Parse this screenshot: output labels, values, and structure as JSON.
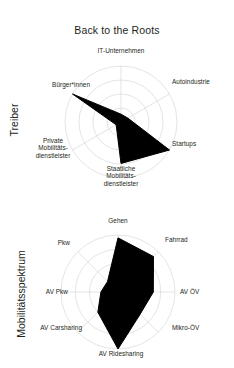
{
  "figure": {
    "title": "Back to the Roots",
    "background": "#ffffff",
    "fill_color": "#000000",
    "grid_color": "#d9d9d9",
    "text_color": "#231f20"
  },
  "panels": [
    {
      "id": "treiber",
      "axis_title": "Treiber",
      "center": {
        "x": 121,
        "y": 122
      },
      "radius": 56,
      "labels": [
        "IT-Unternehmen",
        "Autoindustrie",
        "Startups",
        "Staatliche\nMobilitäts-\ndienstleister",
        "Private\nMobilitäts-\ndienstleister",
        "Bürger*innen"
      ]
    },
    {
      "id": "mobilitaetsspektrum",
      "axis_title": "Mobilitätsspektrum",
      "center": {
        "x": 118,
        "y": 292
      },
      "radius": 57,
      "labels": [
        "Gehen",
        "Fahrrad",
        "AV ÖV",
        "Mikro-ÖV",
        "AV Ridesharing",
        "AV Carsharing",
        "AV Pkw",
        "Pkw"
      ]
    }
  ],
  "chart_data": [
    {
      "type": "radar",
      "title": "Back to the Roots",
      "group": "Treiber",
      "categories": [
        "IT-Unternehmen",
        "Autoindustrie",
        "Startups",
        "Staatliche Mobilitätsdienstleister",
        "Private Mobilitätsdienstleister",
        "Bürger*innen"
      ],
      "values": [
        0.14,
        0.14,
        1.0,
        0.74,
        0.1,
        1.0
      ],
      "rlim": [
        0,
        1
      ],
      "n_rings": 4,
      "grid": true,
      "legend": "none",
      "xlabel": "",
      "ylabel": "Treiber"
    },
    {
      "type": "radar",
      "title": "",
      "group": "Mobilitätsspektrum",
      "categories": [
        "Gehen",
        "Fahrrad",
        "AV ÖV",
        "Mikro-ÖV",
        "AV Ridesharing",
        "AV Carsharing",
        "AV Pkw",
        "Pkw"
      ],
      "values": [
        0.95,
        0.88,
        0.62,
        0.55,
        1.0,
        0.5,
        0.3,
        0.26
      ],
      "rlim": [
        0,
        1
      ],
      "n_rings": 4,
      "grid": true,
      "legend": "none",
      "xlabel": "",
      "ylabel": "Mobilitätsspektrum"
    }
  ]
}
